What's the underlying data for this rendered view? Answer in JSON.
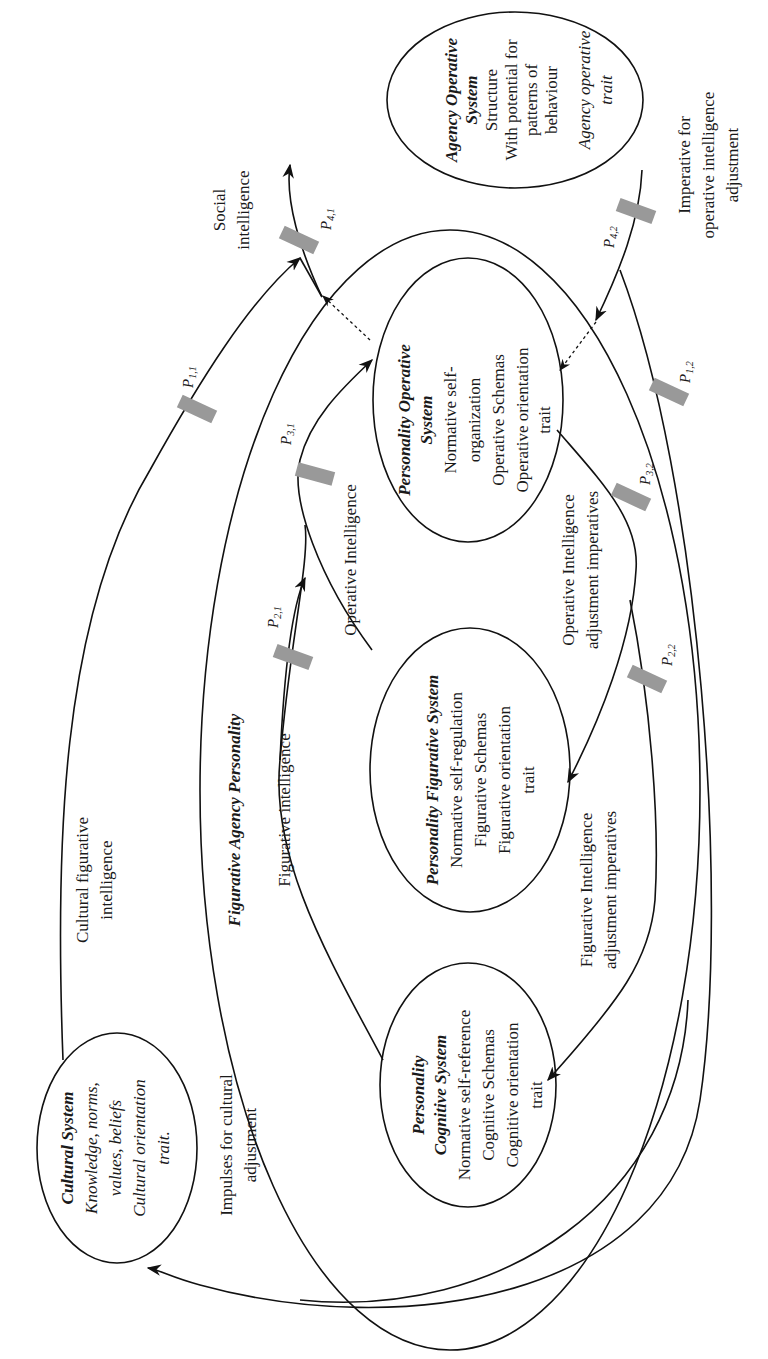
{
  "diagram": {
    "orientation": "rotated 90deg counter-clockwise",
    "nodes": {
      "agency_operative": {
        "title_line1": "Agency Operative",
        "title_line2": "System",
        "lines": [
          "Structure",
          "With potential for",
          "patterns of",
          "behaviour"
        ],
        "trait_line1": "Agency operative",
        "trait_line2": "trait"
      },
      "personality_operative": {
        "title_line1": "Personality Operative",
        "title_line2": "System",
        "lines": [
          "Normative self-",
          "organization",
          "Operative Schemas",
          "Operative orientation",
          "trait"
        ]
      },
      "personality_figurative": {
        "title": "Personality Figurative System",
        "lines": [
          "Normative self-regulation",
          "Figurative Schemas",
          "Figurative orientation",
          "trait"
        ]
      },
      "personality_cognitive": {
        "title_line1": "Personality",
        "title_line2": "Cognitive System",
        "lines": [
          "Normative self-reference",
          "Cognitive Schemas",
          "Cognitive orientation",
          "trait"
        ]
      },
      "cultural": {
        "title": "Cultural System",
        "lines": [
          "Knowledge, norms,",
          "values, beliefs",
          "Cultural orientation",
          "trait."
        ]
      },
      "figurative_agency_personality": {
        "title": "Figurative Agency Personality"
      }
    },
    "edge_labels": {
      "social_intelligence": [
        "Social",
        "intelligence"
      ],
      "imperative_operative": [
        "Imperative for",
        "operative intelligence",
        "adjustment"
      ],
      "cultural_figurative": [
        "Cultural figurative",
        "intelligence"
      ],
      "impulses_cultural": [
        "Impulses for cultural",
        "adjustment"
      ],
      "figurative_intelligence": "Figurative intelligence",
      "operative_intelligence": "Operative Intelligence",
      "operative_adjustment": [
        "Operative Intelligence",
        "adjustment imperatives"
      ],
      "figurative_adjustment": [
        "Figurative Intelligence",
        "adjustment imperatives"
      ]
    },
    "gates": {
      "p11": {
        "base": "P",
        "sub": "1,1"
      },
      "p12": {
        "base": "P",
        "sub": "1,2"
      },
      "p21": {
        "base": "P",
        "sub": "2,1"
      },
      "p22": {
        "base": "P",
        "sub": "2,2"
      },
      "p31": {
        "base": "P",
        "sub": "3,1"
      },
      "p32": {
        "base": "P",
        "sub": "3,2"
      },
      "p41": {
        "base": "P",
        "sub": "4,1"
      },
      "p42": {
        "base": "P",
        "sub": "4,2"
      }
    },
    "colors": {
      "line": "#111111",
      "gate": "#999999",
      "background": "#ffffff"
    }
  }
}
